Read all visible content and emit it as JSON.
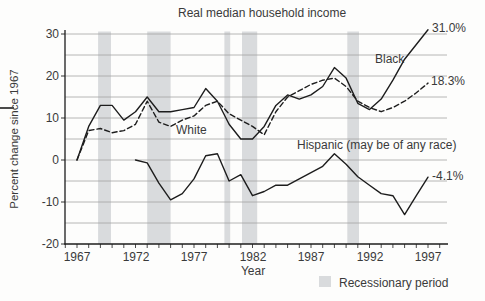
{
  "chart_data": {
    "type": "line",
    "title": "Real median household income",
    "xlabel": "Year",
    "ylabel": "Percent change since 1967",
    "xlim": [
      1966,
      1998.7
    ],
    "ylim": [
      -20,
      30
    ],
    "grid": true,
    "x_ticks": [
      1967,
      1972,
      1977,
      1982,
      1987,
      1992,
      1997
    ],
    "x_minor_tick_range": [
      1966,
      1998
    ],
    "y_ticks": [
      30,
      20,
      10,
      0,
      -10,
      -20
    ],
    "y_tick_labels": [
      "30",
      "20",
      "10",
      "0",
      "-10",
      "-20"
    ],
    "gridline_values": [
      30,
      25,
      20,
      15,
      10,
      5,
      0,
      -5,
      -10,
      -15
    ],
    "series": [
      {
        "name": "Black",
        "label_text": "Black",
        "end_label": "31.0%",
        "line_style": "solid",
        "start_year": 1967,
        "values": [
          0,
          8,
          13,
          13,
          9.5,
          11.5,
          15,
          11.5,
          11.5,
          12,
          12.5,
          17,
          14,
          8.5,
          5,
          5,
          8,
          13,
          15.5,
          14.5,
          15.5,
          17.5,
          22,
          19.5,
          13.5,
          12,
          14.5,
          19,
          24,
          27.5,
          31.0
        ]
      },
      {
        "name": "White",
        "label_text": "White",
        "end_label": "18.3%",
        "line_style": "dashed",
        "start_year": 1967,
        "values": [
          0,
          7,
          7.5,
          6.5,
          7,
          8.5,
          14,
          9,
          8,
          9.5,
          10.5,
          13,
          14,
          11,
          9.5,
          8,
          6,
          11.5,
          15,
          16.5,
          18,
          19,
          19.5,
          17.5,
          14,
          12.5,
          11.5,
          12.5,
          14,
          16,
          18.3
        ]
      },
      {
        "name": "Hispanic",
        "label_text": "Hispanic (may be of any race)",
        "end_label": "-4.1%",
        "line_style": "solid",
        "start_year": 1972,
        "values": [
          0,
          -0.7,
          -5.5,
          -9.5,
          -8,
          -4.5,
          1,
          1.5,
          -5,
          -3.5,
          -8.5,
          -7.5,
          -6,
          -6,
          -4.5,
          -3,
          -1.5,
          1.5,
          -1,
          -4,
          -6,
          -8,
          -8.5,
          -13,
          -8.5,
          -4.1
        ]
      }
    ],
    "recession_bands": [
      [
        1968.8,
        1969.9
      ],
      [
        1973.0,
        1975.0
      ],
      [
        1979.6,
        1980.1
      ],
      [
        1981.1,
        1982.4
      ],
      [
        1990.1,
        1991.1
      ]
    ],
    "legend": {
      "label": "Recessionary period",
      "position": "bottom-right"
    },
    "colors": {
      "line": "#1d1d1d",
      "grid": "#a3a3a3",
      "band": "#d9dbdd",
      "text": "#3a3a3a",
      "background": "#fdfdfc"
    }
  }
}
